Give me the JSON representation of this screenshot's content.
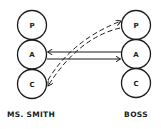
{
  "diagram": {
    "type": "transactional-analysis",
    "colors": {
      "stroke": "#1a1a1a",
      "background": "#ffffff"
    },
    "people": [
      {
        "name": "MS. SMITH",
        "states": [
          {
            "label": "P",
            "cx": 32,
            "cy": 25
          },
          {
            "label": "A",
            "cx": 32,
            "cy": 54
          },
          {
            "label": "C",
            "cx": 32,
            "cy": 84
          }
        ]
      },
      {
        "name": "BOSS",
        "states": [
          {
            "label": "P",
            "cx": 136,
            "cy": 25
          },
          {
            "label": "A",
            "cx": 136,
            "cy": 54
          },
          {
            "label": "C",
            "cx": 136,
            "cy": 83
          }
        ]
      }
    ],
    "transactions": [
      {
        "from": "BOSS.A",
        "to": "MS. SMITH.A",
        "style": "solid"
      },
      {
        "from": "MS. SMITH.A",
        "to": "BOSS.A",
        "style": "solid"
      },
      {
        "from": "MS. SMITH.C",
        "to": "BOSS.P",
        "style": "dashed"
      },
      {
        "from": "BOSS.P",
        "to": "MS. SMITH.C",
        "style": "dashed"
      }
    ]
  }
}
